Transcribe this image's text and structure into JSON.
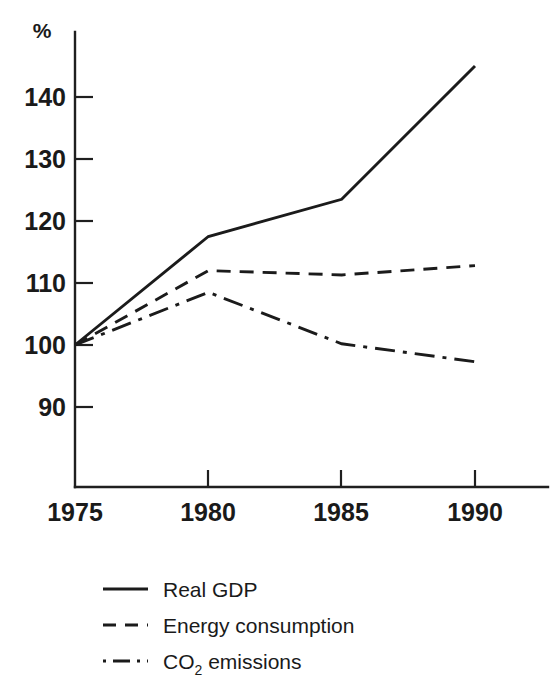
{
  "chart_data": {
    "type": "line",
    "title": "",
    "subtitle": "",
    "xlabel": "",
    "ylabel": "%",
    "unit_label": "%",
    "x": [
      1975,
      1980,
      1985,
      1990
    ],
    "categories": [
      "1975",
      "1980",
      "1985",
      "1990"
    ],
    "xlim": [
      1975,
      1991.5
    ],
    "ylim": [
      86,
      147
    ],
    "yticks": [
      90,
      100,
      110,
      120,
      130,
      140
    ],
    "ytick_labels": [
      "90",
      "100",
      "110",
      "120",
      "130",
      "140"
    ],
    "xticks": [
      1975,
      1980,
      1985,
      1990
    ],
    "xtick_labels": [
      "1975",
      "1980",
      "1985",
      "1990"
    ],
    "grid": false,
    "legend_position": "bottom-left",
    "index_base": "1975 = 100",
    "series": [
      {
        "name": "Real GDP",
        "style": "solid",
        "color": "#1b1b1b",
        "values": [
          100,
          117.5,
          123.5,
          145
        ]
      },
      {
        "name": "Energy consumption",
        "style": "dashed",
        "color": "#1b1b1b",
        "values": [
          100,
          112,
          111.3,
          112.8
        ]
      },
      {
        "name": "CO2 emissions",
        "style": "dashdot",
        "color": "#1b1b1b",
        "values": [
          100,
          108.5,
          100.2,
          97.3
        ]
      }
    ]
  },
  "legend": {
    "items": [
      {
        "label": "Real GDP",
        "style": "solid"
      },
      {
        "label": "Energy consumption",
        "style": "dashed"
      },
      {
        "label": "CO",
        "subscript": "2",
        "suffix": " emissions",
        "style": "dashdot"
      }
    ]
  },
  "axis": {
    "unit": "%",
    "y_labels": [
      "140",
      "130",
      "120",
      "110",
      "100",
      "90"
    ],
    "x_labels": [
      "1975",
      "1980",
      "1985",
      "1990"
    ]
  }
}
